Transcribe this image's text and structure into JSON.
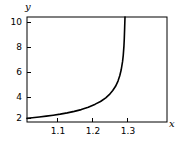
{
  "chart_data": {
    "type": "line",
    "title": "",
    "xlabel": "x",
    "ylabel": "y",
    "xlim": [
      1.055,
      1.455
    ],
    "ylim": [
      0.85,
      10.85
    ],
    "grid": false,
    "legend": null,
    "xticks": [
      1.1,
      1.2,
      1.3
    ],
    "xticklabels": [
      "1.1",
      "1.2",
      "1.3"
    ],
    "yticks": [
      2,
      4,
      6,
      8,
      10
    ],
    "yticklabels": [
      "2",
      "4",
      "6",
      "8",
      "10"
    ],
    "frame": true,
    "line_color": "#000000",
    "line_width": 1.6,
    "asymptote_x": 1.335,
    "series": [
      {
        "name": "curve",
        "x": [
          1.055,
          1.07,
          1.09,
          1.11,
          1.13,
          1.15,
          1.17,
          1.19,
          1.21,
          1.23,
          1.25,
          1.265,
          1.28,
          1.29,
          1.3,
          1.308,
          1.315,
          1.32,
          1.324,
          1.328,
          1.33,
          1.332,
          1.333,
          1.334,
          1.335
        ],
        "y": [
          1.2,
          1.25,
          1.33,
          1.41,
          1.5,
          1.6,
          1.72,
          1.86,
          2.03,
          2.25,
          2.55,
          2.8,
          3.15,
          3.45,
          3.85,
          4.25,
          4.75,
          5.25,
          5.8,
          6.6,
          7.2,
          8.1,
          8.8,
          9.8,
          10.85
        ]
      }
    ]
  },
  "labels": {
    "x_axis_name": "x",
    "y_axis_name": "y",
    "y_tick_10": "10",
    "y_tick_8": "8",
    "y_tick_6": "6",
    "y_tick_4": "4",
    "y_tick_2": "2",
    "x_tick_11": "1.1",
    "x_tick_12": "1.2",
    "x_tick_13": "1.3"
  }
}
